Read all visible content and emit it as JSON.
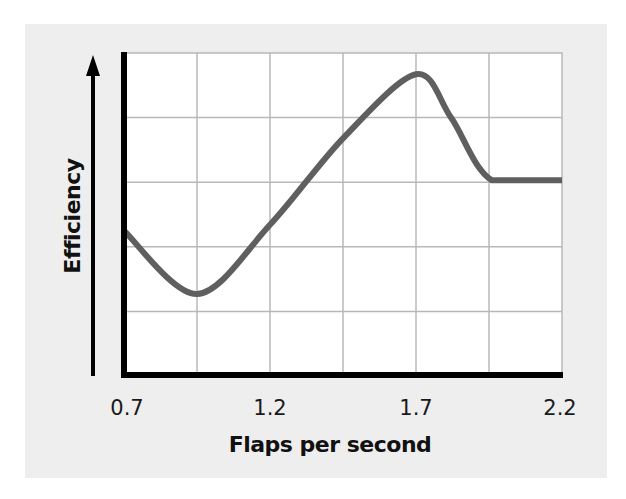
{
  "chart_data": {
    "type": "line",
    "title": "",
    "xlabel": "Flaps per second",
    "ylabel": "Efficiency",
    "x_ticks": [
      "0.7",
      "1.2",
      "1.7",
      "2.2"
    ],
    "xlim": [
      0.7,
      2.2
    ],
    "ylim": [
      0,
      5
    ],
    "y_ticks_shown": false,
    "grid": true,
    "grid_x_step": 0.25,
    "grid_y_step": 1,
    "legend": null,
    "series": [
      {
        "name": "Efficiency",
        "color": "#5f5f5f",
        "x": [
          0.7,
          0.95,
          1.2,
          1.45,
          1.7,
          1.82,
          1.96,
          2.2
        ],
        "y": [
          2.25,
          1.27,
          2.34,
          3.68,
          4.67,
          4.0,
          3.03,
          3.03
        ]
      }
    ]
  },
  "colors": {
    "panel_background": "#eeeeee",
    "plot_background": "#ffffff",
    "grid": "#b8b8b8",
    "axis": "#000000",
    "curve": "#5f5f5f"
  }
}
